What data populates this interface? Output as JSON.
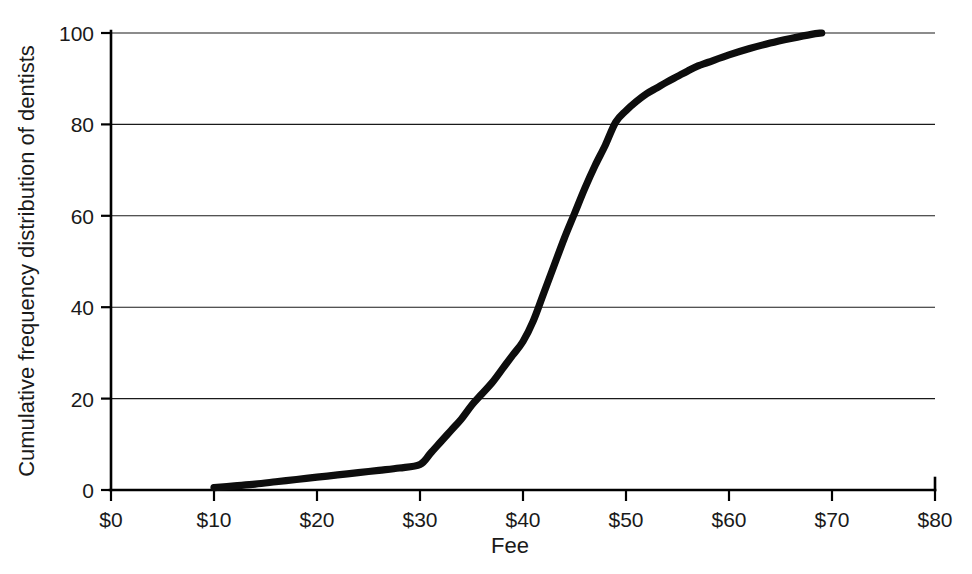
{
  "figure": {
    "title": "",
    "background_color": "#ffffff",
    "ink_color": "#0d0d0d"
  },
  "axes": {
    "x_title": "Fee",
    "y_title": "Cumulative frequency distribution of dentists",
    "x_ticks": [
      "$0",
      "$10",
      "$20",
      "$30",
      "$40",
      "$50",
      "$60",
      "$70",
      "$80"
    ],
    "y_ticks": [
      "0",
      "20",
      "40",
      "60",
      "80",
      "100"
    ]
  },
  "chart_data": {
    "type": "line",
    "title": "",
    "subtitle": "",
    "xlabel": "Fee",
    "ylabel": "Cumulative frequency distribution of dentists",
    "xlim": [
      0,
      80
    ],
    "ylim": [
      0,
      100
    ],
    "xtick_values": [
      0,
      10,
      20,
      30,
      40,
      50,
      60,
      70,
      80
    ],
    "xtick_labels": [
      "$0",
      "$10",
      "$20",
      "$30",
      "$40",
      "$50",
      "$60",
      "$70",
      "$80"
    ],
    "ytick_values": [
      0,
      20,
      40,
      60,
      80,
      100
    ],
    "ytick_labels": [
      "0",
      "20",
      "40",
      "60",
      "80",
      "100"
    ],
    "grid": "horizontal",
    "legend": "none",
    "series": [
      {
        "name": "Cumulative frequency distribution of dentists",
        "color": "#0d0d0d",
        "line_width": 7,
        "x": [
          10,
          12,
          14,
          16,
          18,
          20,
          22,
          24,
          26,
          28,
          30,
          31,
          32,
          33,
          34,
          35,
          36,
          37,
          38,
          39,
          40,
          41,
          42,
          43,
          44,
          45,
          46,
          47,
          48,
          49,
          50,
          51,
          52,
          53,
          54,
          55,
          56,
          57,
          58,
          60,
          62,
          64,
          66,
          68,
          69
        ],
        "y": [
          0.5,
          0.9,
          1.3,
          1.8,
          2.3,
          2.8,
          3.3,
          3.8,
          4.3,
          4.8,
          5.6,
          8.0,
          10.5,
          13.0,
          15.5,
          18.5,
          21.0,
          23.5,
          26.5,
          29.5,
          32.5,
          37.0,
          43.0,
          49.0,
          55.0,
          60.5,
          66.0,
          71.0,
          75.5,
          80.5,
          83.0,
          85.0,
          86.7,
          88.0,
          89.3,
          90.5,
          91.7,
          92.8,
          93.6,
          95.2,
          96.6,
          97.8,
          98.8,
          99.7,
          100.0
        ]
      }
    ]
  },
  "geometry": {
    "plot_left": 111,
    "plot_right": 935,
    "plot_top": 33,
    "plot_bottom": 490
  }
}
